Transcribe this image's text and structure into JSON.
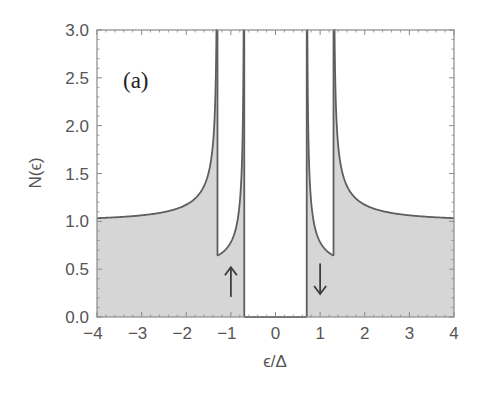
{
  "chart_data": {
    "type": "area",
    "title": "",
    "panel_label": "(a)",
    "xlabel": "ϵ/Δ",
    "ylabel": "N(ϵ)",
    "xlim": [
      -4,
      4
    ],
    "ylim": [
      0,
      3
    ],
    "xticks": [
      -4,
      -3,
      -2,
      -1,
      0,
      1,
      2,
      3,
      4
    ],
    "xtick_labels": [
      "−4",
      "−3",
      "−2",
      "−1",
      "0",
      "1",
      "2",
      "3",
      "4"
    ],
    "yticks": [
      0,
      0.5,
      1,
      1.5,
      2,
      2.5,
      3
    ],
    "ytick_labels": [
      "0.0",
      "0.5",
      "1.0",
      "1.5",
      "2.0",
      "2.5",
      "3.0"
    ],
    "grid": false,
    "legend": null,
    "model": {
      "description": "Spin-split BCS density of states; total N = sum of two spin components each 0.5*|E|/sqrt(E^2-1)",
      "spin_splitting_h": 0.3,
      "gap": 1.0
    },
    "features": {
      "inner_gap_edges": [
        -0.7,
        0.7
      ],
      "outer_gap_edges": [
        -1.3,
        1.3
      ],
      "inner_dip_minimum": 0.64,
      "value_at_x_minus4": 1.03,
      "value_at_x_plus4": 1.03
    },
    "series": [
      {
        "name": "total DOS (shaded)",
        "x": [
          -4,
          -3,
          -2,
          -1.6,
          -1.4,
          -1.32,
          1.32,
          1.4,
          1.6,
          2,
          3,
          4
        ],
        "values": [
          1.03,
          1.06,
          1.15,
          1.35,
          1.85,
          3.0,
          3.0,
          1.85,
          1.35,
          1.15,
          1.06,
          1.03
        ]
      },
      {
        "name": "single-spin DOS between edges",
        "x": [
          -1.3,
          -1.1,
          -0.9,
          -0.78,
          -0.72,
          0.72,
          0.78,
          0.9,
          1.1,
          1.3
        ],
        "values": [
          0.64,
          0.71,
          0.87,
          1.25,
          2.4,
          2.4,
          1.25,
          0.87,
          0.71,
          0.64
        ]
      }
    ],
    "annotations": [
      {
        "type": "arrow",
        "direction": "up",
        "label": "spin-up",
        "x": -1.0,
        "y_from": 0.21,
        "y_to": 0.52
      },
      {
        "type": "arrow",
        "direction": "down",
        "label": "spin-down",
        "x": 1.0,
        "y_from": 0.56,
        "y_to": 0.24
      }
    ],
    "colors": {
      "fill": "#d6d6d6",
      "line": "#5e5e5e",
      "frame": "#8a8a8a",
      "arrow": "#3c3c3c",
      "text": "#555555"
    }
  }
}
